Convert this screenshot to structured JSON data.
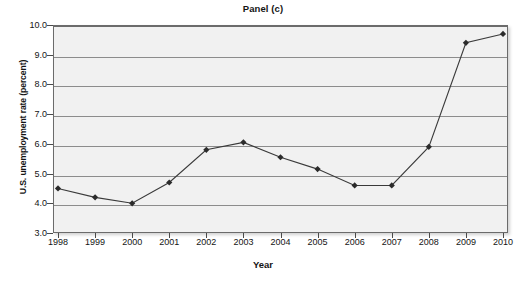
{
  "chart_data": {
    "type": "line",
    "title": "Panel (c)",
    "xlabel": "Year",
    "ylabel": "U.S. unemployment rate (percent)",
    "categories": [
      "1998",
      "1999",
      "2000",
      "2001",
      "2002",
      "2003",
      "2004",
      "2005",
      "2006",
      "2007",
      "2008",
      "2009",
      "2010"
    ],
    "x": [
      1998,
      1999,
      2000,
      2001,
      2002,
      2003,
      2004,
      2005,
      2006,
      2007,
      2008,
      2009,
      2010
    ],
    "values": [
      4.5,
      4.2,
      4.0,
      4.7,
      5.8,
      6.05,
      5.55,
      5.15,
      4.6,
      4.6,
      5.9,
      9.4,
      9.7
    ],
    "series": [
      {
        "name": "U.S. unemployment rate",
        "values": [
          4.5,
          4.2,
          4.0,
          4.7,
          5.8,
          6.05,
          5.55,
          5.15,
          4.6,
          4.6,
          5.9,
          9.4,
          9.7
        ]
      }
    ],
    "ylim": [
      3.0,
      10.0
    ],
    "xlim": [
      1998,
      2010
    ],
    "ytick_labels": [
      "10.0",
      "9.0",
      "8.0",
      "7.0",
      "6.0",
      "5.0",
      "4.0",
      "3.0"
    ],
    "ytick_values": [
      10.0,
      9.0,
      8.0,
      7.0,
      6.0,
      5.0,
      4.0,
      3.0
    ],
    "grid": true,
    "legend": "none",
    "marker": "diamond",
    "line_color": "#3a3a3a",
    "marker_color": "#2b2b2b",
    "plot_background": "#f1f1f1",
    "grid_color": "#8c8c8c"
  }
}
